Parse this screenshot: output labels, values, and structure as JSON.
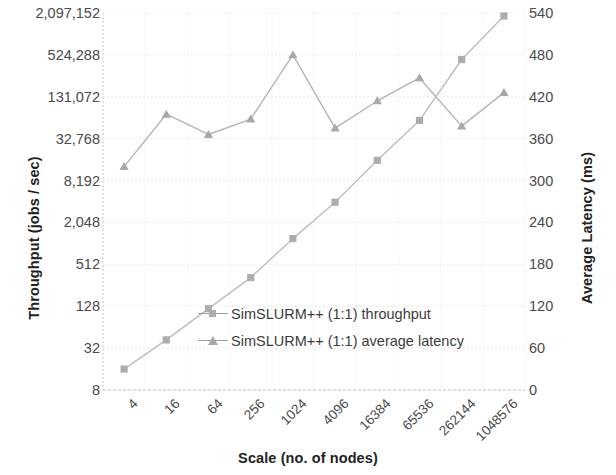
{
  "chart_data": {
    "type": "line",
    "title": "",
    "xlabel": "Scale (no. of nodes)",
    "ylabel": "Throughput (jobs / sec)",
    "y2label": "Average Latency (ms)",
    "grid": true,
    "legend_position": "center",
    "categories": [
      "4",
      "16",
      "64",
      "256",
      "1024",
      "4096",
      "16384",
      "65536",
      "262144",
      "1048576"
    ],
    "x_tick_labels": [
      "4",
      "16",
      "64",
      "256",
      "1024",
      "4096",
      "16384",
      "65536",
      "262144",
      "1048576"
    ],
    "y_tick_labels": [
      "8",
      "32",
      "128",
      "512",
      "2,048",
      "8,192",
      "32,768",
      "131,072",
      "524,288",
      "2,097,152"
    ],
    "y_tick_values": [
      8,
      32,
      128,
      512,
      2048,
      8192,
      32768,
      131072,
      524288,
      2097152
    ],
    "y_scale": "log",
    "y_log_base": 4,
    "ylim": [
      8,
      2097152
    ],
    "y2_tick_labels": [
      "0",
      "60",
      "120",
      "180",
      "240",
      "300",
      "360",
      "420",
      "480",
      "540"
    ],
    "y2_tick_values": [
      0,
      60,
      120,
      180,
      240,
      300,
      360,
      420,
      480,
      540
    ],
    "y2_scale": "linear",
    "y2lim": [
      0,
      540
    ],
    "series": [
      {
        "name": "SimSLURM++ (1:1) throughput",
        "axis": "left",
        "marker": "square",
        "color": "#adadad",
        "line_color": "#bdbdbd",
        "values": [
          16,
          42,
          118,
          330,
          1200,
          4000,
          16000,
          60000,
          450000,
          1900000
        ]
      },
      {
        "name": "SimSLURM++ (1:1) average latency",
        "axis": "right",
        "marker": "triangle",
        "color": "#a8a8a8",
        "line_color": "#b5b5b5",
        "values": [
          320,
          395,
          366,
          388,
          480,
          375,
          414,
          447,
          378,
          426
        ]
      }
    ]
  },
  "legend": {
    "items": [
      {
        "label": "SimSLURM++ (1:1) throughput",
        "marker": "square"
      },
      {
        "label": "SimSLURM++ (1:1) average latency",
        "marker": "triangle"
      }
    ]
  },
  "axes": {
    "left_title": "Throughput (jobs / sec)",
    "right_title": "Average Latency (ms)",
    "bottom_title": "Scale (no. of nodes)"
  }
}
